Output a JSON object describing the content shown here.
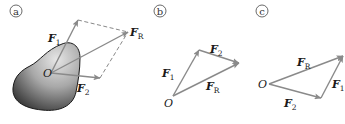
{
  "panels": [
    {
      "id": "a",
      "label": "a",
      "origin_label": "O",
      "vectors": [
        {
          "name": "F1",
          "main": "F",
          "sub": "1"
        },
        {
          "name": "F2",
          "main": "F",
          "sub": "2"
        },
        {
          "name": "FR",
          "main": "F",
          "sub": "R"
        }
      ],
      "description": "Parallelogram law: forces F1 and F2 acting at point O on a body, resultant FR is the diagonal"
    },
    {
      "id": "b",
      "label": "b",
      "origin_label": "O",
      "vectors": [
        {
          "name": "F1",
          "main": "F",
          "sub": "1"
        },
        {
          "name": "F2",
          "main": "F",
          "sub": "2"
        },
        {
          "name": "FR",
          "main": "F",
          "sub": "R"
        }
      ],
      "description": "Triangle rule: F1 then F2 tip-to-tail, FR closes the triangle"
    },
    {
      "id": "c",
      "label": "c",
      "origin_label": "O",
      "vectors": [
        {
          "name": "F2",
          "main": "F",
          "sub": "2"
        },
        {
          "name": "F1",
          "main": "F",
          "sub": "1"
        },
        {
          "name": "FR",
          "main": "F",
          "sub": "R"
        }
      ],
      "description": "Triangle rule: F2 then F1 tip-to-tail, FR closes the triangle"
    }
  ],
  "colors": {
    "arrow": "#8a8a8a",
    "dashed": "#7a7a7a",
    "body_dark": "#2b2b2b",
    "body_light": "#d8d8d8",
    "text": "#1a1a1a"
  }
}
